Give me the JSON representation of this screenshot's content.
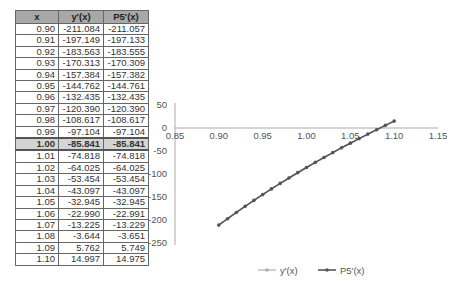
{
  "table": {
    "headers": [
      "x",
      "y'(x)",
      "P5'(x)"
    ],
    "highlight_row": 10,
    "rows": [
      [
        "0.90",
        "-211.084",
        "-211.057"
      ],
      [
        "0.91",
        "-197.149",
        "-197.133"
      ],
      [
        "0.92",
        "-183.563",
        "-183.555"
      ],
      [
        "0.93",
        "-170.313",
        "-170.309"
      ],
      [
        "0.94",
        "-157.384",
        "-157.382"
      ],
      [
        "0.95",
        "-144.762",
        "-144.761"
      ],
      [
        "0.96",
        "-132.435",
        "-132.435"
      ],
      [
        "0.97",
        "-120.390",
        "-120.390"
      ],
      [
        "0.98",
        "-108.617",
        "-108.617"
      ],
      [
        "0.99",
        "-97.104",
        "-97.104"
      ],
      [
        "1.00",
        "-85.841",
        "-85.841"
      ],
      [
        "1.01",
        "-74.818",
        "-74.818"
      ],
      [
        "1.02",
        "-64.025",
        "-64.025"
      ],
      [
        "1.03",
        "-53.454",
        "-53.454"
      ],
      [
        "1.04",
        "-43.097",
        "-43.097"
      ],
      [
        "1.05",
        "-32.945",
        "-32.945"
      ],
      [
        "1.06",
        "-22.990",
        "-22.991"
      ],
      [
        "1.07",
        "-13.225",
        "-13.229"
      ],
      [
        "1.08",
        "-3.644",
        "-3.651"
      ],
      [
        "1.09",
        "5.762",
        "5.749"
      ],
      [
        "1.10",
        "14.997",
        "14.975"
      ]
    ]
  },
  "chart_data": {
    "type": "line",
    "title": "",
    "xlabel": "",
    "ylabel": "",
    "xlim": [
      0.85,
      1.15
    ],
    "ylim": [
      -250,
      50
    ],
    "x_ticks": [
      "0.85",
      "0.90",
      "0.95",
      "1.00",
      "1.05",
      "1.10",
      "1.15"
    ],
    "y_ticks": [
      "50",
      "0",
      "-50",
      "-100",
      "-150",
      "-200",
      "-250"
    ],
    "grid": false,
    "legend_position": "bottom",
    "x": [
      0.9,
      0.91,
      0.92,
      0.93,
      0.94,
      0.95,
      0.96,
      0.97,
      0.98,
      0.99,
      1.0,
      1.01,
      1.02,
      1.03,
      1.04,
      1.05,
      1.06,
      1.07,
      1.08,
      1.09,
      1.1
    ],
    "series": [
      {
        "name": "y'(x)",
        "color": "#b0b0b0",
        "values": [
          -211.084,
          -197.149,
          -183.563,
          -170.313,
          -157.384,
          -144.762,
          -132.435,
          -120.39,
          -108.617,
          -97.104,
          -85.841,
          -74.818,
          -64.025,
          -53.454,
          -43.097,
          -32.945,
          -22.99,
          -13.225,
          -3.644,
          5.762,
          14.997
        ]
      },
      {
        "name": "P5'(x)",
        "color": "#555555",
        "values": [
          -211.057,
          -197.133,
          -183.555,
          -170.309,
          -157.382,
          -144.761,
          -132.435,
          -120.39,
          -108.617,
          -97.104,
          -85.841,
          -74.818,
          -64.025,
          -53.454,
          -43.097,
          -32.945,
          -22.991,
          -13.229,
          -3.651,
          5.749,
          14.975
        ]
      }
    ]
  }
}
